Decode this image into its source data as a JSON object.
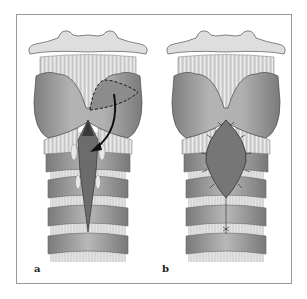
{
  "figure": {
    "panels": [
      {
        "id": "a",
        "label": "a",
        "description": "Larynx and trachea, anterior view, with dashed outline of thyroid cartilage flap and curved arrow showing flap transposed into laryngotracheal opening"
      },
      {
        "id": "b",
        "label": "b",
        "description": "Larynx and trachea, anterior view, with flap sutured into anterior laryngotracheal defect"
      }
    ],
    "colors": {
      "frame": "#9a9a9a",
      "hyoid": "#dcdcdc",
      "membrane": "#eeeeee",
      "cartilage": "#a9a9a9",
      "cartilage_dark": "#8a8a8a",
      "flap": "#7c7c7c",
      "lumen": "#6e6e6e",
      "rings": "#9c9c9c",
      "outline": "#555555",
      "arrow": "#111111"
    }
  }
}
